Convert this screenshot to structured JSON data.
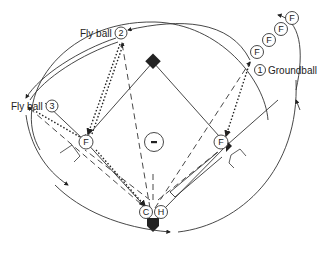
{
  "diagram": {
    "type": "baseball-field-drill",
    "labels": {
      "fly_ball_2": "Fly ball",
      "fly_ball_3": "Fly ball",
      "groundball": "Groundball"
    },
    "numbers": {
      "n1": "1",
      "n2": "2",
      "n3": "3"
    },
    "players": {
      "fielder": "F",
      "catcher": "C",
      "hitter": "H",
      "pitcher": "-"
    },
    "queue_count": 4,
    "colors": {
      "line": "#333333",
      "fill": "#222222",
      "background": "#ffffff"
    }
  }
}
